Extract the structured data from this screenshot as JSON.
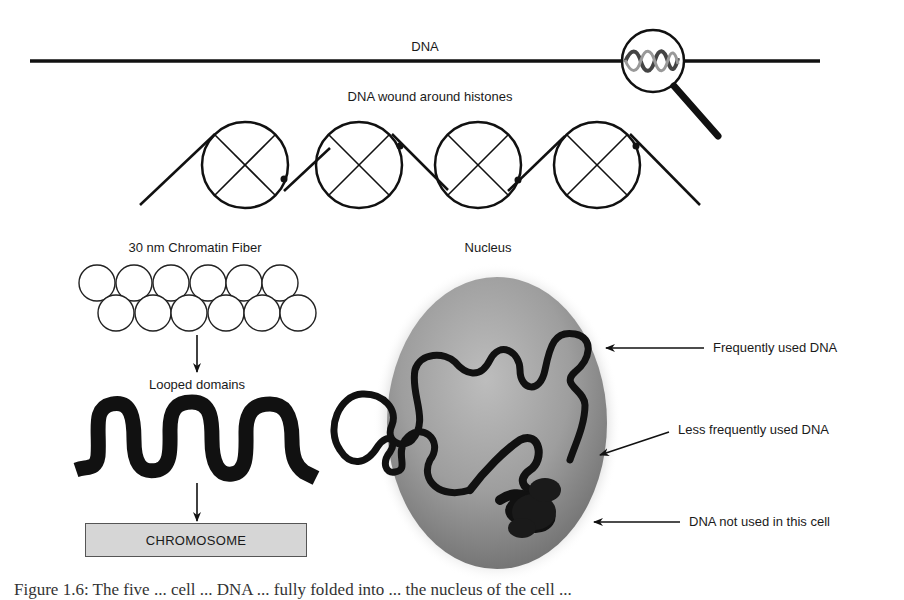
{
  "labels": {
    "dna": "DNA",
    "dna_wound": "DNA wound around histones",
    "chromatin_fiber": "30 nm Chromatin Fiber",
    "looped_domains": "Looped domains",
    "chromosome": "CHROMOSOME",
    "nucleus": "Nucleus",
    "frequently_used": "Frequently used DNA",
    "less_frequently_used": "Less frequently used DNA",
    "not_used": "DNA not used in this cell"
  },
  "caption": "Figure 1.6: The five ... cell ... DNA ... fully folded into ... the nucleus of the cell ...",
  "colors": {
    "line": "#111111",
    "chromosome_fill": "#d6d6d6",
    "nucleus_fill": "#9a9a9a",
    "nucleus_halo": "#e6e6e6"
  },
  "diagram": {
    "stages": [
      "DNA",
      "DNA wound around histones",
      "30 nm Chromatin Fiber",
      "Looped domains",
      "CHROMOSOME"
    ],
    "histone_count": 4,
    "chromatin_fiber_circles": {
      "top_row": 6,
      "bottom_row": 6
    },
    "nucleus_annotations": [
      "Frequently used DNA",
      "Less frequently used DNA",
      "DNA not used in this cell"
    ]
  }
}
